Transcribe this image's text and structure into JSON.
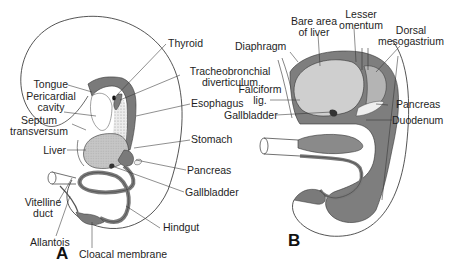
{
  "figure": {
    "colors": {
      "outline": "#2a2a2a",
      "endoderm_dark": "#7a7a7a",
      "organ_light": "#c9c9c9",
      "mesentery_mid": "#9a9a9a",
      "background": "#ffffff"
    },
    "panel_a": {
      "letter": "A",
      "labels": {
        "thyroid": "Thyroid",
        "tracheobronchial_1": "Tracheobronchial",
        "tracheobronchial_2": "diverticulum",
        "tongue": "Tongue",
        "pericardial_1": "Pericardial",
        "pericardial_2": "cavity",
        "septum_1": "Septum",
        "septum_2": "transversum",
        "esophagus": "Esophagus",
        "stomach": "Stomach",
        "liver": "Liver",
        "pancreas": "Pancreas",
        "gallbladder": "Gallbladder",
        "vitelline_1": "Vitelline",
        "vitelline_2": "duct",
        "hindgut": "Hindgut",
        "allantois": "Allantois",
        "cloacal": "Cloacal membrane"
      }
    },
    "panel_b": {
      "letter": "B",
      "labels": {
        "bare_area_1": "Bare area",
        "bare_area_2": "of liver",
        "lesser_omentum_1": "Lesser",
        "lesser_omentum_2": "omentum",
        "dorsal_1": "Dorsal",
        "dorsal_2": "mesogastrium",
        "diaphragm": "Diaphragm",
        "falciform_1": "Falciform",
        "falciform_2": "lig.",
        "gallbladder": "Gallbladder",
        "pancreas": "Pancreas",
        "duodenum": "Duodenum"
      }
    }
  }
}
